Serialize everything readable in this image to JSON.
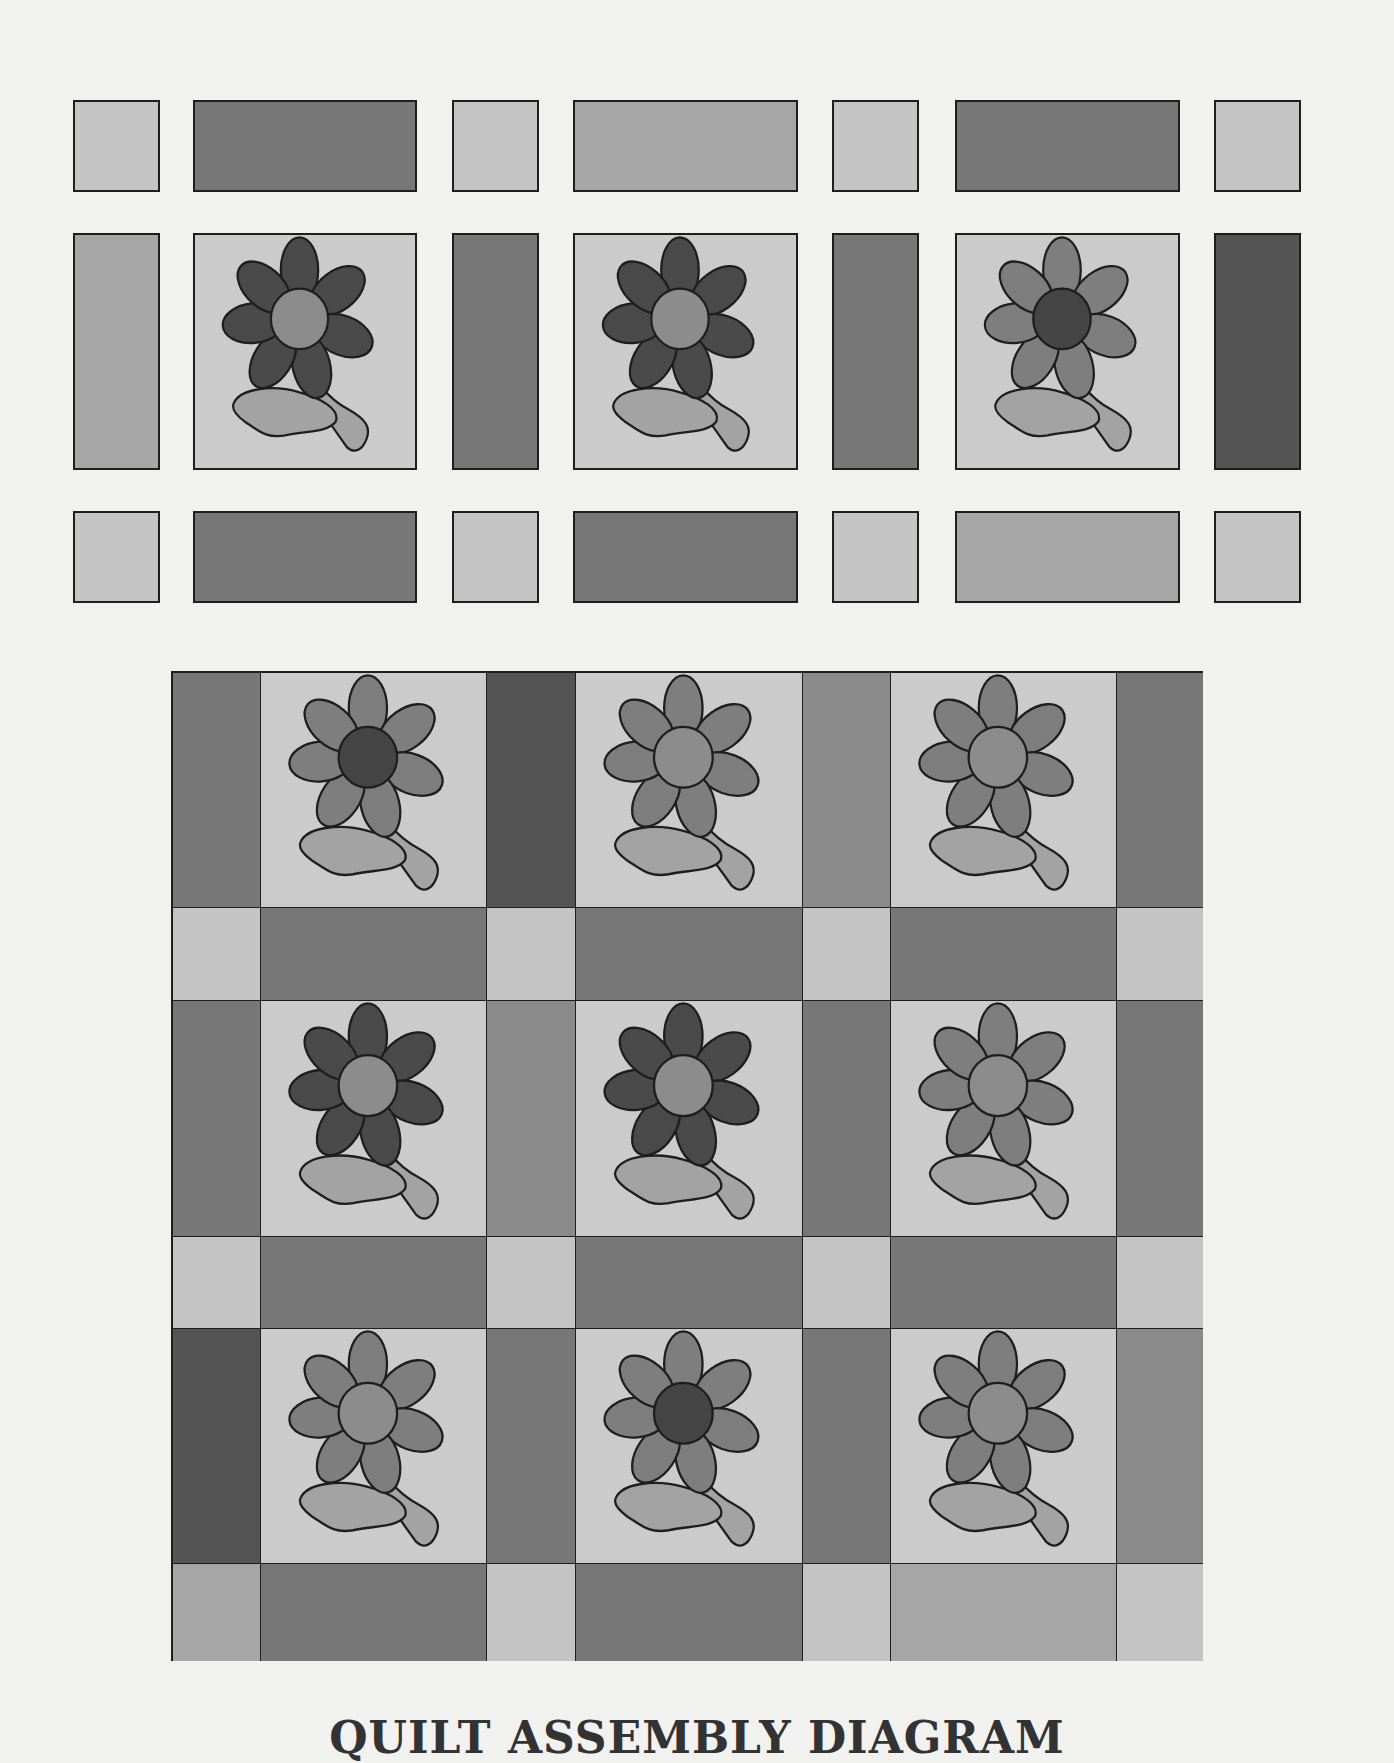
{
  "title": "QUILT ASSEMBLY DIAGRAM",
  "palette": {
    "cornerstone": "#c4c4c4",
    "sash_light": "#a6a6a6",
    "sash_medium": "#8a8a8a",
    "sash_mediumdark": "#777777",
    "sash_dark": "#545454",
    "block_bg": "#cbcbcb",
    "petal_dark": "#4a4a4a",
    "petal_medium": "#7e7e7e",
    "center_light": "#8c8c8c",
    "center_dark": "#454545",
    "leaf": "#a3a3a3",
    "outline": "#1e1e1e"
  },
  "exploded_view": {
    "rows": [
      {
        "y": 100,
        "h": 92,
        "type": "sashing-row",
        "pieces": [
          {
            "kind": "cornerstone",
            "fill": "cornerstone"
          },
          {
            "kind": "sash",
            "fill": "sash_mediumdark"
          },
          {
            "kind": "cornerstone",
            "fill": "cornerstone"
          },
          {
            "kind": "sash",
            "fill": "sash_light"
          },
          {
            "kind": "cornerstone",
            "fill": "cornerstone"
          },
          {
            "kind": "sash",
            "fill": "sash_mediumdark"
          },
          {
            "kind": "cornerstone",
            "fill": "cornerstone"
          }
        ]
      },
      {
        "y": 233,
        "h": 237,
        "type": "block-row",
        "pieces": [
          {
            "kind": "sash",
            "fill": "sash_light"
          },
          {
            "kind": "block",
            "petals": "petal_dark",
            "center": "center_light"
          },
          {
            "kind": "sash",
            "fill": "sash_mediumdark"
          },
          {
            "kind": "block",
            "petals": "petal_dark",
            "center": "center_light"
          },
          {
            "kind": "sash",
            "fill": "sash_mediumdark"
          },
          {
            "kind": "block",
            "petals": "petal_medium",
            "center": "center_dark"
          },
          {
            "kind": "sash",
            "fill": "sash_dark"
          }
        ]
      },
      {
        "y": 511,
        "h": 92,
        "type": "sashing-row",
        "pieces": [
          {
            "kind": "cornerstone",
            "fill": "cornerstone"
          },
          {
            "kind": "sash",
            "fill": "sash_mediumdark"
          },
          {
            "kind": "cornerstone",
            "fill": "cornerstone"
          },
          {
            "kind": "sash",
            "fill": "sash_mediumdark"
          },
          {
            "kind": "cornerstone",
            "fill": "cornerstone"
          },
          {
            "kind": "sash",
            "fill": "sash_light"
          },
          {
            "kind": "cornerstone",
            "fill": "cornerstone"
          }
        ]
      }
    ]
  },
  "assembled_quilt": {
    "rows": [
      {
        "type": "block-row",
        "cells": [
          {
            "kind": "sash",
            "fill": "sash_mediumdark"
          },
          {
            "kind": "block",
            "petals": "petal_medium",
            "center": "center_dark"
          },
          {
            "kind": "sash",
            "fill": "sash_dark"
          },
          {
            "kind": "block",
            "petals": "petal_medium",
            "center": "center_light"
          },
          {
            "kind": "sash",
            "fill": "sash_medium"
          },
          {
            "kind": "block",
            "petals": "petal_medium",
            "center": "center_light"
          },
          {
            "kind": "sash",
            "fill": "sash_mediumdark"
          }
        ]
      },
      {
        "type": "sashing-row",
        "cells": [
          {
            "kind": "cornerstone",
            "fill": "cornerstone"
          },
          {
            "kind": "sash",
            "fill": "sash_mediumdark"
          },
          {
            "kind": "cornerstone",
            "fill": "cornerstone"
          },
          {
            "kind": "sash",
            "fill": "sash_mediumdark"
          },
          {
            "kind": "cornerstone",
            "fill": "cornerstone"
          },
          {
            "kind": "sash",
            "fill": "sash_mediumdark"
          },
          {
            "kind": "cornerstone",
            "fill": "cornerstone"
          }
        ]
      },
      {
        "type": "block-row",
        "cells": [
          {
            "kind": "sash",
            "fill": "sash_mediumdark"
          },
          {
            "kind": "block",
            "petals": "petal_dark",
            "center": "center_light"
          },
          {
            "kind": "sash",
            "fill": "sash_medium"
          },
          {
            "kind": "block",
            "petals": "petal_dark",
            "center": "center_light"
          },
          {
            "kind": "sash",
            "fill": "sash_mediumdark"
          },
          {
            "kind": "block",
            "petals": "petal_medium",
            "center": "center_light"
          },
          {
            "kind": "sash",
            "fill": "sash_mediumdark"
          }
        ]
      },
      {
        "type": "sashing-row",
        "cells": [
          {
            "kind": "cornerstone",
            "fill": "cornerstone"
          },
          {
            "kind": "sash",
            "fill": "sash_mediumdark"
          },
          {
            "kind": "cornerstone",
            "fill": "cornerstone"
          },
          {
            "kind": "sash",
            "fill": "sash_mediumdark"
          },
          {
            "kind": "cornerstone",
            "fill": "cornerstone"
          },
          {
            "kind": "sash",
            "fill": "sash_mediumdark"
          },
          {
            "kind": "cornerstone",
            "fill": "cornerstone"
          }
        ]
      },
      {
        "type": "block-row",
        "cells": [
          {
            "kind": "sash",
            "fill": "sash_dark"
          },
          {
            "kind": "block",
            "petals": "petal_medium",
            "center": "center_light"
          },
          {
            "kind": "sash",
            "fill": "sash_mediumdark"
          },
          {
            "kind": "block",
            "petals": "petal_medium",
            "center": "center_dark"
          },
          {
            "kind": "sash",
            "fill": "sash_mediumdark"
          },
          {
            "kind": "block",
            "petals": "petal_medium",
            "center": "center_light"
          },
          {
            "kind": "sash",
            "fill": "sash_medium"
          }
        ]
      },
      {
        "type": "sashing-row",
        "cells": [
          {
            "kind": "cornerstone",
            "fill": "sash_light"
          },
          {
            "kind": "sash",
            "fill": "sash_mediumdark"
          },
          {
            "kind": "cornerstone",
            "fill": "cornerstone"
          },
          {
            "kind": "sash",
            "fill": "sash_mediumdark"
          },
          {
            "kind": "cornerstone",
            "fill": "cornerstone"
          },
          {
            "kind": "sash",
            "fill": "sash_light"
          },
          {
            "kind": "cornerstone",
            "fill": "cornerstone"
          }
        ]
      }
    ]
  }
}
